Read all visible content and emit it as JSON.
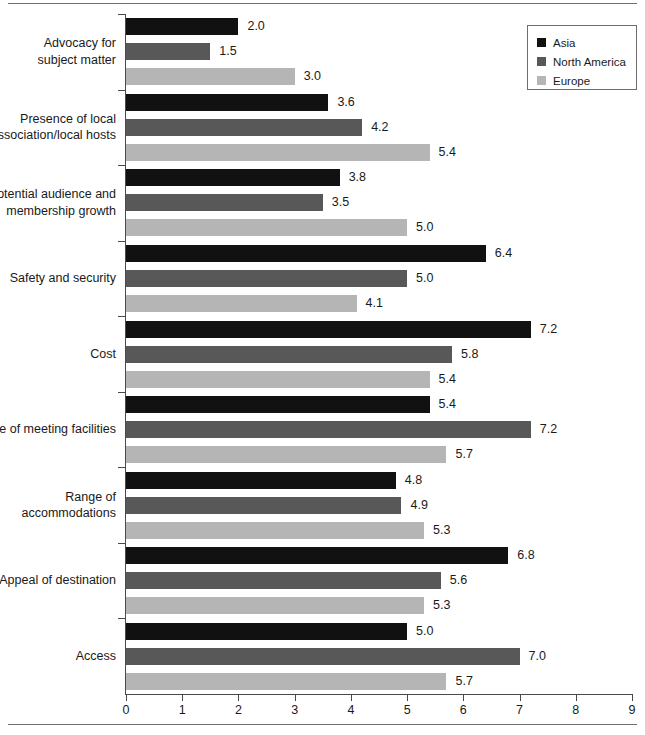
{
  "chart_data": {
    "type": "bar",
    "orientation": "horizontal",
    "title": "",
    "subtitle": "",
    "xlabel": "",
    "ylabel": "",
    "xlim": [
      0,
      9
    ],
    "x_ticks": [
      "0",
      "1",
      "2",
      "3",
      "4",
      "5",
      "6",
      "7",
      "8",
      "9"
    ],
    "grid": false,
    "legend_position": "top-right",
    "categories": [
      "Advocacy for\nsubject matter",
      "Presence of local\nassociation/local hosts",
      "Potential audience and\nmembership growth",
      "Safety and security",
      "Cost",
      "Size of meeting facilities",
      "Range of\naccommodations",
      "Appeal of destination",
      "Access"
    ],
    "category_lines": [
      [
        "Advocacy for",
        "subject matter"
      ],
      [
        "Presence of local",
        "association/local hosts"
      ],
      [
        "Potential audience and",
        "membership growth"
      ],
      [
        "Safety and security"
      ],
      [
        "Cost"
      ],
      [
        "Size of meeting facilities"
      ],
      [
        "Range of",
        "accommodations"
      ],
      [
        "Appeal of destination"
      ],
      [
        "Access"
      ]
    ],
    "series": [
      {
        "name": "Asia",
        "color": "#111111",
        "values": [
          2.0,
          3.6,
          3.8,
          6.4,
          7.2,
          5.4,
          4.8,
          6.8,
          5.0
        ],
        "labels": [
          "2.0",
          "3.6",
          "3.8",
          "6.4",
          "7.2",
          "5.4",
          "4.8",
          "6.8",
          "5.0"
        ]
      },
      {
        "name": "North America",
        "color": "#585858",
        "values": [
          1.5,
          4.2,
          3.5,
          5.0,
          5.8,
          7.2,
          4.9,
          5.6,
          7.0
        ],
        "labels": [
          "1.5",
          "4.2",
          "3.5",
          "5.0",
          "5.8",
          "7.2",
          "4.9",
          "5.6",
          "7.0"
        ]
      },
      {
        "name": "Europe",
        "color": "#b5b5b5",
        "values": [
          3.0,
          5.4,
          5.0,
          4.1,
          5.4,
          5.7,
          5.3,
          5.3,
          5.7
        ],
        "labels": [
          "3.0",
          "5.4",
          "5.0",
          "4.1",
          "5.4",
          "5.7",
          "5.3",
          "5.3",
          "5.7"
        ]
      }
    ]
  },
  "legend": {
    "items": [
      {
        "label": "Asia",
        "color": "#111111",
        "key": "asia"
      },
      {
        "label": "North America",
        "color": "#585858",
        "key": "north-america"
      },
      {
        "label": "Europe",
        "color": "#b5b5b5",
        "key": "europe"
      }
    ]
  }
}
